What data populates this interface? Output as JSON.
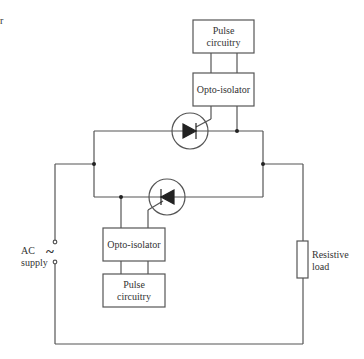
{
  "diagram": {
    "corner_fragment": "r",
    "components": {
      "pulse_top": {
        "line1": "Pulse",
        "line2": "circuitry"
      },
      "opto_top": {
        "label": "Opto-isolator"
      },
      "opto_bottom": {
        "label": "Opto-isolator"
      },
      "pulse_bottom": {
        "line1": "Pulse",
        "line2": "circuitry"
      },
      "ac_supply": {
        "line1": "AC",
        "line2": "supply",
        "symbol": "~"
      },
      "load": {
        "line1": "Resistive",
        "line2": "load"
      }
    },
    "colors": {
      "wire": "#555555",
      "text": "#333333",
      "background": "#ffffff"
    }
  }
}
